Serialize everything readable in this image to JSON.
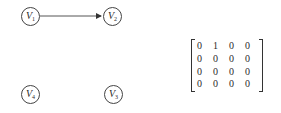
{
  "graph": {
    "nodes": [
      {
        "id": "V1",
        "letter": "V",
        "sub": "1"
      },
      {
        "id": "V2",
        "letter": "V",
        "sub": "2"
      },
      {
        "id": "V3",
        "letter": "V",
        "sub": "3"
      },
      {
        "id": "V4",
        "letter": "V",
        "sub": "4"
      }
    ],
    "edges": [
      {
        "from": "V1",
        "to": "V2",
        "directed": true
      }
    ]
  },
  "matrix": {
    "rows": [
      [
        "0",
        "1",
        "0",
        "0"
      ],
      [
        "0",
        "0",
        "0",
        "0"
      ],
      [
        "0",
        "0",
        "0",
        "0"
      ],
      [
        "0",
        "0",
        "0",
        "0"
      ]
    ]
  }
}
